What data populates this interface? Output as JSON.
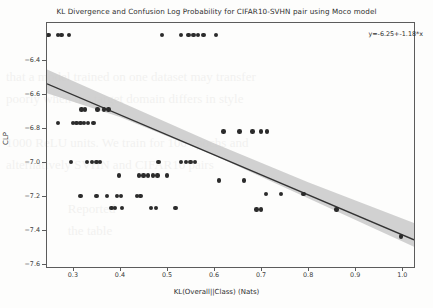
{
  "chart_data": {
    "type": "scatter",
    "title": "KL Divergence and Confusion Log Probability for CIFAR10-SVHN pair using Moco model",
    "xlabel": "KL(Overall||Class) (Nats)",
    "ylabel": "CLP",
    "xlim": [
      0.245,
      1.025
    ],
    "ylim": [
      -7.62,
      -6.18
    ],
    "grid": false,
    "legend": false,
    "annotation": "y=-6.25+-1.18*x",
    "fit": {
      "intercept": -6.25,
      "slope": -1.18,
      "line_color": "#333333",
      "band_color": "#c9c9c9",
      "band_label": "95% confidence interval"
    },
    "xticks": [
      0.3,
      0.4,
      0.5,
      0.6,
      0.7,
      0.8,
      0.9,
      1.0
    ],
    "xtick_labels": [
      "0.3",
      "0.4",
      "0.5",
      "0.6",
      "0.7",
      "0.8",
      "0.9",
      "1.0"
    ],
    "yticks": [
      -6.4,
      -6.6,
      -6.8,
      -7.0,
      -7.2,
      -7.4,
      -7.6
    ],
    "ytick_labels": [
      "-6.4",
      "-6.6",
      "-6.8",
      "-7.0",
      "-7.2",
      "-7.4",
      "-7.6"
    ],
    "point_color": "#2b2b2b",
    "points": [
      [
        0.248,
        -6.25
      ],
      [
        0.268,
        -6.25
      ],
      [
        0.276,
        -6.25
      ],
      [
        0.292,
        -6.25
      ],
      [
        0.49,
        -6.25
      ],
      [
        0.53,
        -6.25
      ],
      [
        0.546,
        -6.25
      ],
      [
        0.556,
        -6.25
      ],
      [
        0.566,
        -6.25
      ],
      [
        0.578,
        -6.25
      ],
      [
        0.604,
        -6.25
      ],
      [
        0.318,
        -6.69
      ],
      [
        0.326,
        -6.69
      ],
      [
        0.352,
        -6.69
      ],
      [
        0.366,
        -6.69
      ],
      [
        0.376,
        -6.69
      ],
      [
        0.268,
        -6.77
      ],
      [
        0.3,
        -6.77
      ],
      [
        0.308,
        -6.77
      ],
      [
        0.316,
        -6.77
      ],
      [
        0.324,
        -6.77
      ],
      [
        0.332,
        -6.77
      ],
      [
        0.344,
        -6.77
      ],
      [
        0.62,
        -6.82
      ],
      [
        0.654,
        -6.82
      ],
      [
        0.682,
        -6.82
      ],
      [
        0.7,
        -6.82
      ],
      [
        0.712,
        -6.82
      ],
      [
        0.296,
        -7.0
      ],
      [
        0.33,
        -7.0
      ],
      [
        0.34,
        -7.0
      ],
      [
        0.35,
        -7.0
      ],
      [
        0.358,
        -7.0
      ],
      [
        0.482,
        -7.0
      ],
      [
        0.53,
        -7.0
      ],
      [
        0.54,
        -7.0
      ],
      [
        0.55,
        -7.0
      ],
      [
        0.56,
        -7.0
      ],
      [
        0.398,
        -7.08
      ],
      [
        0.44,
        -7.08
      ],
      [
        0.45,
        -7.08
      ],
      [
        0.46,
        -7.08
      ],
      [
        0.47,
        -7.08
      ],
      [
        0.48,
        -7.08
      ],
      [
        0.5,
        -7.08
      ],
      [
        0.61,
        -7.11
      ],
      [
        0.664,
        -7.11
      ],
      [
        0.316,
        -7.2
      ],
      [
        0.35,
        -7.2
      ],
      [
        0.372,
        -7.2
      ],
      [
        0.394,
        -7.2
      ],
      [
        0.402,
        -7.2
      ],
      [
        0.436,
        -7.2
      ],
      [
        0.444,
        -7.2
      ],
      [
        0.71,
        -7.19
      ],
      [
        0.742,
        -7.19
      ],
      [
        0.79,
        -7.19
      ],
      [
        0.382,
        -7.27
      ],
      [
        0.39,
        -7.27
      ],
      [
        0.404,
        -7.27
      ],
      [
        0.466,
        -7.27
      ],
      [
        0.476,
        -7.27
      ],
      [
        0.518,
        -7.27
      ],
      [
        0.69,
        -7.28
      ],
      [
        0.7,
        -7.28
      ],
      [
        0.86,
        -7.28
      ],
      [
        0.998,
        -7.44
      ]
    ],
    "band_upper": [
      [
        0.245,
        -6.455
      ],
      [
        0.4,
        -6.645
      ],
      [
        0.6,
        -6.89
      ],
      [
        0.8,
        -7.12
      ],
      [
        1.025,
        -7.36
      ]
    ],
    "band_lower": [
      [
        0.245,
        -6.595
      ],
      [
        0.4,
        -6.735
      ],
      [
        0.6,
        -6.96
      ],
      [
        0.8,
        -7.215
      ],
      [
        1.025,
        -7.5
      ]
    ]
  }
}
